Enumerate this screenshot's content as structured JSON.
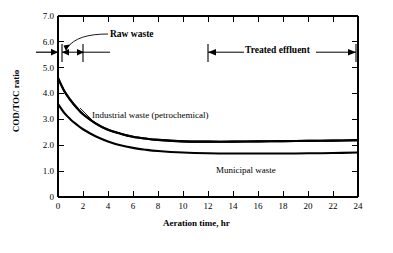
{
  "chart_data": {
    "type": "line",
    "title": "",
    "xlabel": "Aeration time, hr",
    "ylabel": "COD/TOC ratio",
    "xlim": [
      0,
      24
    ],
    "ylim": [
      0,
      7.0
    ],
    "xticks": [
      0,
      2,
      4,
      6,
      8,
      10,
      12,
      14,
      16,
      18,
      20,
      22,
      24
    ],
    "xtick_labels": [
      "0",
      "2",
      "4",
      "6",
      "8",
      "10",
      "12",
      "14",
      "16",
      "18",
      "20",
      "22",
      "24"
    ],
    "yticks": [
      0,
      1.0,
      2.0,
      3.0,
      4.0,
      5.0,
      6.0,
      7.0
    ],
    "ytick_labels": [
      "0",
      "1.0",
      "2.0",
      "3.0",
      "4.0",
      "5.0",
      "6.0",
      "7.0"
    ],
    "grid": false,
    "legend_position": "inline-labels",
    "series": [
      {
        "name": "Industrial waste (petrochemical)",
        "x": [
          0,
          0.5,
          1,
          1.5,
          2,
          3,
          4,
          5,
          6,
          7,
          8,
          10,
          12,
          14,
          16,
          18,
          20,
          22,
          24
        ],
        "values": [
          4.6,
          4.1,
          3.75,
          3.45,
          3.2,
          2.85,
          2.6,
          2.45,
          2.33,
          2.26,
          2.21,
          2.15,
          2.14,
          2.14,
          2.15,
          2.16,
          2.17,
          2.18,
          2.2
        ]
      },
      {
        "name": "Municipal waste",
        "x": [
          0,
          0.5,
          1,
          1.5,
          2,
          3,
          4,
          5,
          6,
          7,
          8,
          10,
          12,
          14,
          16,
          18,
          20,
          22,
          24
        ],
        "values": [
          3.6,
          3.25,
          3.0,
          2.8,
          2.62,
          2.35,
          2.15,
          2.0,
          1.9,
          1.83,
          1.78,
          1.72,
          1.69,
          1.68,
          1.68,
          1.68,
          1.69,
          1.7,
          1.72
        ]
      }
    ],
    "annotations": [
      {
        "name": "raw-waste",
        "text": "Raw waste",
        "span_x": [
          0,
          2
        ],
        "y_level": 5.6
      },
      {
        "name": "treated-effluent",
        "text": "Treated effluent",
        "span_x": [
          12,
          24
        ],
        "y_level": 5.6
      },
      {
        "name": "raw-waste-axis-marker",
        "text": "",
        "y_value": 5.6
      }
    ],
    "series_labels": [
      {
        "name": "industrial-waste-label",
        "text": "Industrial waste (petrochemical)"
      },
      {
        "name": "municipal-waste-label",
        "text": "Municipal waste"
      }
    ],
    "colors": {
      "line": "#000000",
      "axis": "#000000",
      "background": "#ffffff"
    }
  },
  "labels": {
    "ylabel": "COD/TOC ratio",
    "xlabel": "Aeration time, hr",
    "raw_waste": "Raw waste",
    "treated_effluent": "Treated effluent",
    "industrial_waste": "Industrial waste (petrochemical)",
    "municipal_waste": "Municipal waste"
  },
  "yticks": {
    "t0": "7.0",
    "t1": "6.0",
    "t2": "5.0",
    "t3": "4.0",
    "t4": "3.0",
    "t5": "2.0",
    "t6": "1.0",
    "t7": "0"
  },
  "xticks": {
    "t0": "0",
    "t1": "2",
    "t2": "4",
    "t3": "6",
    "t4": "8",
    "t5": "10",
    "t6": "12",
    "t7": "14",
    "t8": "16",
    "t9": "18",
    "t10": "20",
    "t11": "22",
    "t12": "24"
  }
}
